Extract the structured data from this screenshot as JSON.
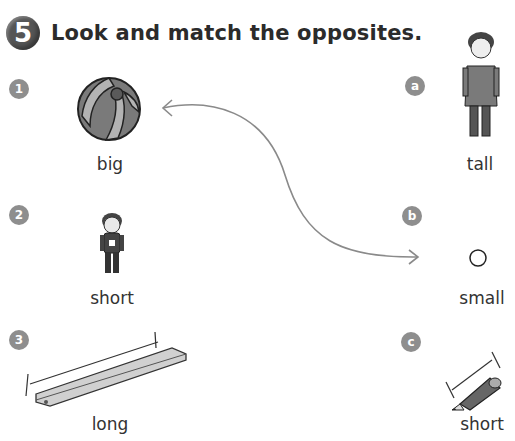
{
  "exercise": {
    "number": "5",
    "instruction": "Look and match the opposites."
  },
  "left_items": [
    {
      "marker": "1",
      "picture": "beach-ball",
      "word": "big"
    },
    {
      "marker": "2",
      "picture": "short-boy",
      "word": "short"
    },
    {
      "marker": "3",
      "picture": "long-ruler",
      "word": "long"
    }
  ],
  "right_items": [
    {
      "marker": "a",
      "picture": "tall-man",
      "word": "tall"
    },
    {
      "marker": "b",
      "picture": "small-ball",
      "word": "small"
    },
    {
      "marker": "c",
      "picture": "short-pencil",
      "word": "short"
    }
  ],
  "example_match": {
    "from": "1",
    "to": "b",
    "color": "#8a8a8a"
  },
  "colors": {
    "badge": "#555555",
    "marker": "#8e8e8e",
    "text": "#333333"
  }
}
